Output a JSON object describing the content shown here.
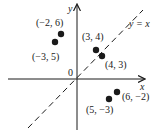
{
  "diagram": {
    "title": "",
    "axes": {
      "x_label": "x",
      "y_label": "y",
      "origin_label": "0"
    },
    "line": {
      "label": "y = x",
      "style": "dashed"
    },
    "points": [
      {
        "label": "(−2, 6)",
        "x": -2,
        "y": 6
      },
      {
        "label": "(−3, 5)",
        "x": -3,
        "y": 5
      },
      {
        "label": "(3, 4)",
        "x": 3,
        "y": 4
      },
      {
        "label": "(4, 3)",
        "x": 4,
        "y": 3
      },
      {
        "label": "(6, −2)",
        "x": 6,
        "y": -2
      },
      {
        "label": "(5, −3)",
        "x": 5,
        "y": -3
      }
    ],
    "colors": {
      "ink": "#1a1a1a",
      "background": "#ffffff"
    }
  }
}
